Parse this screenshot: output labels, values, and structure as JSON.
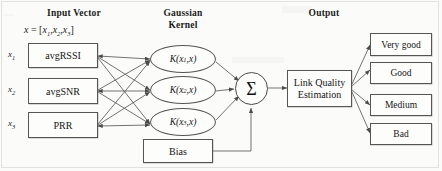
{
  "diagram": {
    "headers": {
      "input": "Input Vector",
      "kernel_line1": "Gaussian",
      "kernel_line2": "Kernel",
      "output": "Output"
    },
    "input_formula": {
      "lhs": "x",
      "eq": "=",
      "open": "[",
      "terms": [
        "x",
        "x",
        "x"
      ],
      "subs": [
        "1",
        "2",
        "3"
      ],
      "commas": [
        ",",
        ","
      ],
      "close": "]"
    },
    "input_nodes": [
      {
        "var": "x",
        "sub": "1",
        "label": "avgRSSI"
      },
      {
        "var": "x",
        "sub": "2",
        "label": "avgSNR"
      },
      {
        "var": "x",
        "sub": "3",
        "label": "PRR"
      }
    ],
    "kernel_nodes": [
      {
        "fn": "K",
        "open": "(",
        "arg": "x",
        "sub": "1",
        "comma": ",",
        "arg2": "x",
        "close": ")"
      },
      {
        "fn": "K",
        "open": "(",
        "arg": "x",
        "sub": "2",
        "comma": ",",
        "arg2": "x",
        "close": ")"
      },
      {
        "fn": "K",
        "open": "(",
        "arg": "x",
        "sub": "3",
        "comma": ",",
        "arg2": "x",
        "close": ")"
      }
    ],
    "bias": {
      "label": "Bias"
    },
    "sum_node": {
      "symbol": "Σ"
    },
    "estimator": {
      "line1": "Link Quality",
      "line2": "Estimation"
    },
    "outputs": [
      {
        "label": "Very good"
      },
      {
        "label": "Good"
      },
      {
        "label": "Medium"
      },
      {
        "label": "Bad"
      }
    ],
    "colors": {
      "stroke": "#555553",
      "text": "#151515",
      "page": "#fbfbfa"
    }
  }
}
